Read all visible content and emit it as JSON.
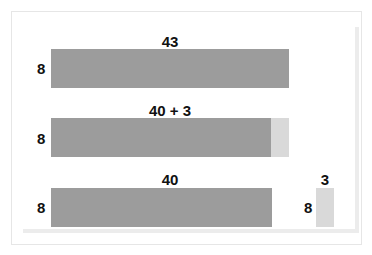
{
  "colors": {
    "dark_bar": "#9c9c9c",
    "light_bar": "#d9d9d9",
    "text": "#111111"
  },
  "rows": [
    {
      "height_label": "8",
      "top_label": "43"
    },
    {
      "height_label": "8",
      "top_label": "40 + 3"
    },
    {
      "height_label": "8",
      "top_label": "40",
      "small_height_label": "8",
      "small_top_label": "3"
    }
  ]
}
